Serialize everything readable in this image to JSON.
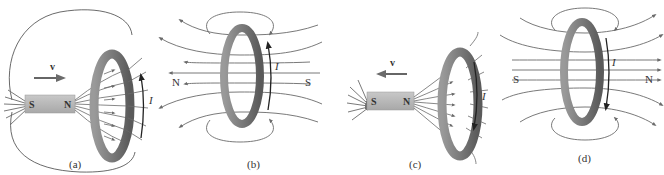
{
  "figure": {
    "colors": {
      "field_line": "#6a6a6a",
      "arrow": "#6b6b6b",
      "magnet": "#b8b8b8",
      "ring_outer": "#8a8a8a",
      "ring_inner": "#5c5c5c",
      "current_arrow": "#222222",
      "text": "#333333"
    },
    "panels": [
      {
        "id": "a",
        "label": "(a)",
        "velocity_label": "v⃗",
        "velocity_direction": "right",
        "magnet": {
          "left_pole": "S",
          "right_pole": "N"
        },
        "current_label": "I",
        "current_direction": "up",
        "caption": "Magnet moves toward the loop"
      },
      {
        "id": "b",
        "label": "(b)",
        "left_pole_label": "N",
        "right_pole_label": "S",
        "current_label": "I",
        "current_direction": "up",
        "field_direction": "left",
        "caption": "Induced field of the loop"
      },
      {
        "id": "c",
        "label": "(c)",
        "velocity_label": "v⃗",
        "velocity_direction": "left",
        "magnet": {
          "left_pole": "S",
          "right_pole": "N"
        },
        "current_label": "I",
        "current_direction": "down",
        "caption": "Magnet moves away from the loop"
      },
      {
        "id": "d",
        "label": "(d)",
        "left_pole_label": "S",
        "right_pole_label": "N",
        "current_label": "I",
        "current_direction": "down",
        "field_direction": "right",
        "caption": "Induced field of the loop"
      }
    ]
  }
}
